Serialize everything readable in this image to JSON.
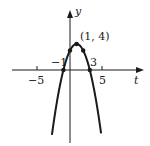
{
  "chart_data": {
    "type": "line",
    "title": "",
    "xlabel": "t",
    "ylabel": "y",
    "function": "y = -(t-1)^2 + 4",
    "x_ticks": [
      -5,
      5
    ],
    "x_tick_labels": [
      "−5",
      "5"
    ],
    "xlim": [
      -5.5,
      8.5
    ],
    "ylim": [
      -10,
      6
    ],
    "grid": false,
    "legend": null,
    "series": [
      {
        "name": "parabola",
        "x": [
          -2.74,
          -2,
          -1,
          0,
          1,
          2,
          3,
          4,
          4.74
        ],
        "values": [
          -10,
          -5,
          0,
          3,
          4,
          3,
          0,
          -5,
          -10
        ]
      }
    ],
    "marked_points": [
      {
        "t": -1,
        "y": 0,
        "label": "−1"
      },
      {
        "t": 0,
        "y": 3,
        "label": ""
      },
      {
        "t": 1,
        "y": 4,
        "label": "(1, 4)"
      },
      {
        "t": 2,
        "y": 3,
        "label": ""
      },
      {
        "t": 3,
        "y": 0,
        "label": "3"
      }
    ],
    "annotations": [
      "(1, 4)",
      "−1",
      "3"
    ]
  },
  "labels": {
    "y_axis": "y",
    "t_axis": "t",
    "vertex": "(1, 4)",
    "root_left": "−1",
    "root_right": "3",
    "tick_neg5": "−5",
    "tick_pos5": "5"
  }
}
